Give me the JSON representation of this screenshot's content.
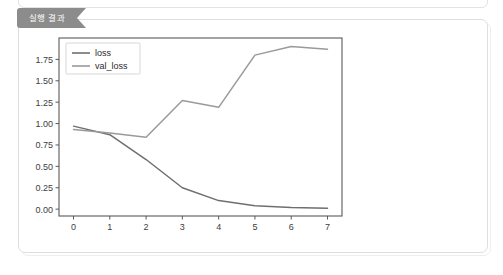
{
  "panel": {
    "tab_label": "실행 결과",
    "tab_color": "#8c8c8c",
    "card_background": "#ffffff",
    "card_border_color": "#dedede"
  },
  "chart_data": {
    "type": "line",
    "title": "",
    "xlabel": "",
    "ylabel": "",
    "x": [
      0,
      1,
      2,
      3,
      4,
      5,
      6,
      7
    ],
    "xlim": [
      -0.4,
      7.4
    ],
    "ylim": [
      -0.08,
      2.0
    ],
    "xticks": [
      "0",
      "1",
      "2",
      "3",
      "4",
      "5",
      "6",
      "7"
    ],
    "yticks": [
      "0.00",
      "0.25",
      "0.50",
      "0.75",
      "1.00",
      "1.25",
      "1.50",
      "1.75"
    ],
    "ytick_values": [
      0.0,
      0.25,
      0.5,
      0.75,
      1.0,
      1.25,
      1.5,
      1.75
    ],
    "grid": false,
    "legend_position": "upper left",
    "series": [
      {
        "name": "loss",
        "color": "#6f6f6f",
        "values": [
          0.97,
          0.87,
          0.58,
          0.25,
          0.1,
          0.04,
          0.02,
          0.01
        ]
      },
      {
        "name": "val_loss",
        "color": "#9a9a9a",
        "values": [
          0.93,
          0.89,
          0.84,
          1.27,
          1.19,
          1.8,
          1.9,
          1.87
        ]
      }
    ]
  }
}
